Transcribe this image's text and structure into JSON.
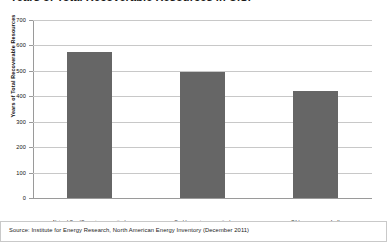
{
  "chart_data": {
    "type": "bar",
    "title": "Years of Total Recoverable Resources in U.S.",
    "xlabel": "",
    "ylabel": "Years of Total Recoverable Resources",
    "categories": [
      "Natural Gas (Current consumption)",
      "Coal (current consumption)",
      "Oil (passenger car fuel)"
    ],
    "values": [
      575,
      495,
      420
    ],
    "ylim": [
      0,
      700
    ],
    "ytick_step": 100,
    "yticks": [
      0,
      100,
      200,
      300,
      400,
      500,
      600,
      700
    ],
    "ytick_labels": [
      "0",
      "100",
      "200",
      "300",
      "400",
      "500",
      "600",
      "700"
    ],
    "grid": true,
    "legend": false,
    "series": [
      {
        "name": "Years of Total Recoverable Resources",
        "values": [
          575,
          495,
          420
        ]
      }
    ],
    "colors": {
      "bar": "#666666",
      "gridline": "#c8c8c8",
      "axis": "#9a9a9a",
      "text": "#111111",
      "background": "#ffffff"
    }
  },
  "source": {
    "text": "Source: Institute for Energy Research, North American Energy Inventory (December 2011)"
  }
}
